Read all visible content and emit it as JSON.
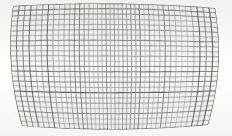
{
  "image": {
    "kind": "scanned-figure",
    "subject": "warped rectangular wire mesh grid",
    "width": 232,
    "height": 136,
    "caption": ""
  },
  "colors": {
    "page_background": "#ffffff",
    "paper_background": "#f6f5f1",
    "grid_line": "#7a7a7a",
    "grid_line_dark": "#5e5e5e",
    "grid_line_light": "#9a9a9a",
    "speckle": "#c8c6c0"
  },
  "mesh": {
    "u_lines": 41,
    "v_lines": 25,
    "line_width_min": 0.55,
    "line_width_max": 1.15,
    "cell_spacing_px": 5,
    "corners": {
      "top_left": [
        13,
        6
      ],
      "top_right": [
        215,
        8
      ],
      "bottom_right": [
        208,
        125
      ],
      "bottom_left": [
        22,
        126
      ]
    },
    "edge_curvature": {
      "left_bulge_px": -6.5,
      "right_bulge_px": 7.0,
      "top_bulge_px": -3.0,
      "bottom_bulge_px": 3.5
    },
    "description": "cylindrically bent grid sheet, concave left edge, convex right edge"
  },
  "texture": {
    "speckle_count": 170,
    "vignette_opacity": 0.06,
    "noise_opacity": 0.1
  }
}
